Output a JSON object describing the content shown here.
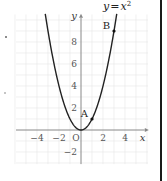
{
  "chart_data": {
    "type": "line",
    "title_parts": {
      "lhs": "y",
      "eq": "=",
      "rhs": "x",
      "exp": "2"
    },
    "xlabel": "x",
    "ylabel": "y",
    "origin_label": "O",
    "xlim": [
      -6,
      6
    ],
    "ylim": [
      -3,
      10.5
    ],
    "grid": true,
    "x_ticks": [
      -4,
      -2,
      2,
      4
    ],
    "x_tick_labels": [
      "−4",
      "−2",
      "2",
      "4"
    ],
    "y_ticks": [
      -2,
      2,
      4,
      6,
      8
    ],
    "y_tick_labels": [
      "−2",
      "2",
      "4",
      "6",
      "8"
    ],
    "series": [
      {
        "name": "y = x^2",
        "function": "x^2",
        "x_range": [
          -3.25,
          3.25
        ],
        "color": "#222222"
      }
    ],
    "points": [
      {
        "label": "A",
        "x": 1,
        "y": 1
      },
      {
        "label": "B",
        "x": 3,
        "y": 9
      }
    ],
    "colors": {
      "grid": "#e6e6e6",
      "axis": "#888888",
      "curve": "#222222"
    }
  }
}
